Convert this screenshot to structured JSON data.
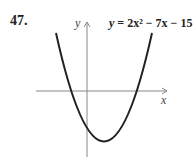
{
  "problem_number": "47.",
  "equation": {
    "lhs": "y",
    "rhs_text": "= 2x² − 7x − 15"
  },
  "axes": {
    "x_label": "x",
    "y_label": "y"
  },
  "colors": {
    "curve": "#222222",
    "axes": "#888888"
  }
}
